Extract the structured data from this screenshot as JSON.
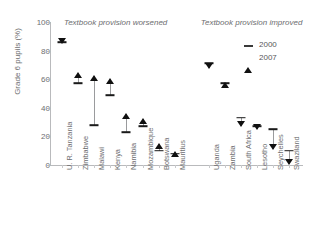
{
  "chart_data": {
    "type": "scatter",
    "title": "",
    "xlabel": "",
    "ylabel": "Grade 6 pupils (%)",
    "ylim": [
      0,
      100
    ],
    "yticks": [
      0,
      20,
      40,
      60,
      80,
      100
    ],
    "grid": false,
    "legend_position": "top-right",
    "legend": [
      "2000",
      "2007"
    ],
    "group_labels": [
      "Textbook provision worsened",
      "Textbook provision improved"
    ],
    "categories": [
      "U. R. Tanzania",
      "Zimbabwe",
      "Malawi",
      "Kenya",
      "Namibia",
      "Mozambique",
      "Botswana",
      "Mauritius",
      "Uganda",
      "Zambia",
      "South Africa",
      "Lesotho",
      "Seychelles",
      "Swaziland"
    ],
    "series": [
      {
        "name": "2000",
        "values": [
          86,
          57,
          28,
          49,
          23,
          27,
          10,
          8,
          71,
          57,
          33,
          27,
          25,
          10
        ]
      },
      {
        "name": "2007",
        "values": [
          85,
          64,
          62,
          60,
          36,
          32,
          15,
          9,
          68,
          57,
          27,
          25,
          11,
          1
        ]
      }
    ],
    "groups": [
      {
        "label": "Textbook provision worsened",
        "categories": [
          "U. R. Tanzania",
          "Zimbabwe",
          "Malawi",
          "Kenya",
          "Namibia",
          "Mozambique",
          "Botswana",
          "Mauritius"
        ]
      },
      {
        "label": "Textbook provision improved",
        "categories": [
          "Uganda",
          "Zambia",
          "South Africa",
          "Lesotho",
          "Seychelles",
          "Swaziland"
        ]
      }
    ]
  },
  "colors": {
    "axis": "#b9babc",
    "text": "#6d6e70",
    "marker_2000": "#1a1a1a",
    "marker_2007": "#101010",
    "connector": "#9a9b9d",
    "background": "#ffffff"
  }
}
